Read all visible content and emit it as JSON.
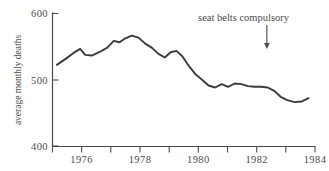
{
  "chart_data": {
    "type": "line",
    "title": "",
    "xlabel": "",
    "ylabel": "average monthly deaths",
    "xlim": [
      1975.0,
      1984.0
    ],
    "ylim": [
      400,
      600
    ],
    "grid": false,
    "legend": null,
    "y_ticks": [
      400,
      500,
      600
    ],
    "y_tick_labels": [
      "400",
      "500",
      "600"
    ],
    "x_major_ticks": [
      1976,
      1978,
      1980,
      1982,
      1984
    ],
    "x_major_tick_labels": [
      "1976",
      "1978",
      "1980",
      "1982",
      "1984"
    ],
    "x_minor_ticks": [
      1975,
      1977,
      1979,
      1981,
      1983
    ],
    "series": [
      {
        "name": "average monthly deaths",
        "x": [
          1975.15,
          1975.45,
          1975.72,
          1975.95,
          1976.12,
          1976.35,
          1976.6,
          1976.88,
          1977.1,
          1977.3,
          1977.5,
          1977.72,
          1977.95,
          1978.18,
          1978.4,
          1978.62,
          1978.85,
          1979.05,
          1979.25,
          1979.45,
          1979.68,
          1979.9,
          1980.12,
          1980.35,
          1980.58,
          1980.8,
          1981.02,
          1981.25,
          1981.48,
          1981.7,
          1981.92,
          1982.15,
          1982.38,
          1982.6,
          1982.82,
          1983.05,
          1983.3,
          1983.55,
          1983.78
        ],
        "y": [
          522,
          531,
          540,
          546,
          537,
          536,
          541,
          548,
          558,
          556,
          562,
          566,
          563,
          554,
          548,
          539,
          533,
          541,
          543,
          535,
          520,
          508,
          500,
          491,
          488,
          493,
          489,
          494,
          493,
          490,
          489,
          489,
          488,
          483,
          474,
          469,
          466,
          467,
          472
        ]
      }
    ],
    "annotations": [
      {
        "name": "seat-belts-compulsory",
        "text": "seat belts compulsory",
        "x_text": 1981.55,
        "y_text": 588,
        "arrow_x": 1982.35,
        "arrow_y_from": 582,
        "arrow_y_to": 546
      }
    ],
    "colors": {
      "series_line": "#3b3b3b",
      "axis": "#4a4a4a",
      "text": "#4a4a4a",
      "background": "#ffffff"
    }
  }
}
